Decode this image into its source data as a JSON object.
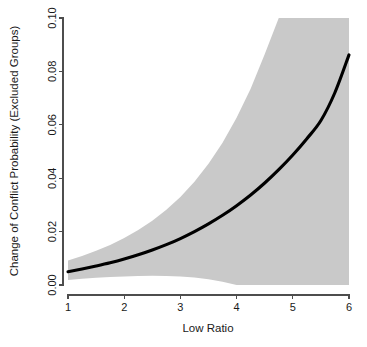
{
  "chart_data": {
    "type": "line",
    "title": "",
    "subtitle": "",
    "xlabel": "Low Ratio",
    "ylabel": "Change of Conflict Probability (Excluded Groups)",
    "xlim": [
      1,
      6
    ],
    "ylim": [
      0.0,
      0.1
    ],
    "xticks": [
      "1",
      "2",
      "3",
      "4",
      "5",
      "6"
    ],
    "xtick_values": [
      1,
      2,
      3,
      4,
      5,
      6
    ],
    "yticks": [
      "0.00",
      "0.02",
      "0.04",
      "0.06",
      "0.08",
      "0.10"
    ],
    "ytick_values": [
      0.0,
      0.02,
      0.04,
      0.06,
      0.08,
      0.1
    ],
    "grid": false,
    "legend": null,
    "legend_position": "none",
    "x": [
      1.0,
      1.25,
      1.5,
      1.75,
      2.0,
      2.25,
      2.5,
      2.75,
      3.0,
      3.25,
      3.5,
      3.75,
      4.0,
      4.25,
      4.5,
      4.75,
      5.0,
      5.25,
      5.5,
      5.75,
      6.0
    ],
    "series": [
      {
        "name": "Predicted change in conflict probability",
        "style": "solid-black-line",
        "color": "#000000",
        "values": [
          0.005,
          0.006,
          0.0071,
          0.0083,
          0.0097,
          0.0113,
          0.0131,
          0.0151,
          0.0174,
          0.02,
          0.0229,
          0.0261,
          0.0297,
          0.0337,
          0.0382,
          0.0432,
          0.0487,
          0.0548,
          0.0616,
          0.0721,
          0.0862
        ]
      }
    ],
    "confidence_band": {
      "name": "95% confidence interval",
      "color": "#c9c9c9",
      "upper": [
        0.0092,
        0.0109,
        0.0128,
        0.015,
        0.0176,
        0.0206,
        0.0241,
        0.0282,
        0.033,
        0.0387,
        0.0454,
        0.0533,
        0.0626,
        0.0735,
        0.0864,
        0.1,
        0.1,
        0.1,
        0.1,
        0.1,
        0.1
      ],
      "lower": [
        0.0019,
        0.0023,
        0.0027,
        0.003,
        0.0032,
        0.0034,
        0.0035,
        0.0034,
        0.0032,
        0.0028,
        0.0022,
        0.0012,
        0.0,
        0.0,
        0.0,
        0.0,
        0.0,
        0.0,
        0.0,
        0.0,
        0.0
      ],
      "upper_clipped_at_x": 5.0,
      "lower_reaches_zero_at_x": 3.8
    },
    "colors": {
      "line": "#000000",
      "band": "#c9c9c9",
      "axis": "#4d4d4d",
      "text": "#1a1a1a",
      "background": "#ffffff"
    },
    "plot_area_px": {
      "left": 68,
      "right": 349,
      "top": 18,
      "bottom": 285
    }
  }
}
